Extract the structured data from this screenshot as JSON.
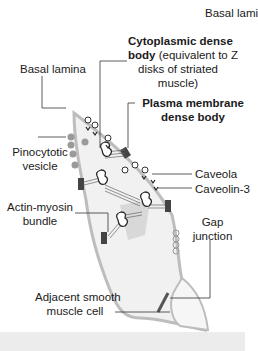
{
  "diagram": {
    "labels": {
      "basal_lamina_top": "Basal lamina",
      "cytoplasmic_dense_body_bold": "Cytoplasmic dense",
      "cytoplasmic_dense_body_line2_bold": "body",
      "cytoplasmic_dense_body_line2_rest": " (equivalent to Z",
      "cytoplasmic_dense_body_line3": "disks of striated",
      "cytoplasmic_dense_body_line4": "muscle)",
      "basal_lamina_left": "Basal lamina",
      "plasma_membrane_line1": "Plasma membrane",
      "plasma_membrane_line2": "dense body",
      "pinocytotic_line1": "Pinocytotic",
      "pinocytotic_line2": "vesicle",
      "caveola": "Caveola",
      "caveolin": "Caveolin-3",
      "actin_line1": "Actin-myosin",
      "actin_line2": "bundle",
      "gap_line1": "Gap",
      "gap_line2": "junction",
      "adjacent_line1": "Adjacent smooth",
      "adjacent_line2": "muscle cell"
    },
    "colors": {
      "cell_fill": "#f1f1f1",
      "cell_outline": "#b8b8b8",
      "dense_body": "#444444",
      "vesicle": "#9a9a9a",
      "nucleus_shadow": "#d6d6d6",
      "leader_line": "#333333",
      "bottom_bar": "#ececec"
    }
  }
}
